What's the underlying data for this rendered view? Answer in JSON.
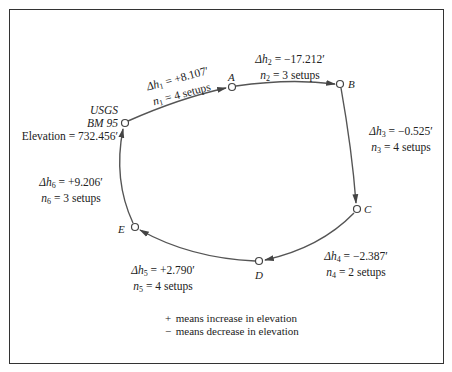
{
  "diagram": {
    "type": "leveling-loop",
    "benchmark": {
      "agency": "USGS",
      "name": "BM 95",
      "elevation_label": "Elevation = 732.456′"
    },
    "nodes": [
      {
        "id": "BM",
        "label": ""
      },
      {
        "id": "A",
        "label": "A"
      },
      {
        "id": "B",
        "label": "B"
      },
      {
        "id": "C",
        "label": "C"
      },
      {
        "id": "D",
        "label": "D"
      },
      {
        "id": "E",
        "label": "E"
      }
    ],
    "legs": [
      {
        "from": "BM",
        "to": "A",
        "dh_prefix": "Δh",
        "sub": "1",
        "dh_value": "= +8.107′",
        "n_prefix": "n",
        "n_value": "= 4 setups"
      },
      {
        "from": "A",
        "to": "B",
        "dh_prefix": "Δh",
        "sub": "2",
        "dh_value": "= −17.212′",
        "n_prefix": "n",
        "n_value": "= 3 setups"
      },
      {
        "from": "B",
        "to": "C",
        "dh_prefix": "Δh",
        "sub": "3",
        "dh_value": "= −0.525′",
        "n_prefix": "n",
        "n_value": "= 4 setups"
      },
      {
        "from": "C",
        "to": "D",
        "dh_prefix": "Δh",
        "sub": "4",
        "dh_value": "= −2.387′",
        "n_prefix": "n",
        "n_value": "= 2 setups"
      },
      {
        "from": "D",
        "to": "E",
        "dh_prefix": "Δh",
        "sub": "5",
        "dh_value": "= +2.790′",
        "n_prefix": "n",
        "n_value": "= 4 setups"
      },
      {
        "from": "E",
        "to": "BM",
        "dh_prefix": "Δh",
        "sub": "6",
        "dh_value": "= +9.206′",
        "n_prefix": "n",
        "n_value": "= 3 setups"
      }
    ],
    "legend": [
      {
        "symbol": "+",
        "text": "means increase in elevation"
      },
      {
        "symbol": "−",
        "text": "means decrease in elevation"
      }
    ]
  }
}
